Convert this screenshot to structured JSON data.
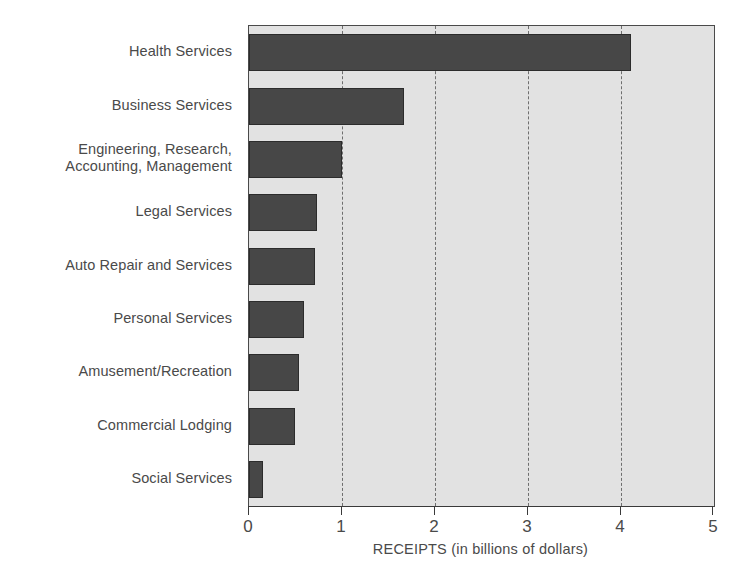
{
  "chart_data": {
    "type": "bar",
    "orientation": "horizontal",
    "title": "",
    "xlabel": "RECEIPTS (in billions of dollars)",
    "ylabel": "",
    "xlim": [
      0,
      5
    ],
    "xticks": [
      "0",
      "1",
      "2",
      "3",
      "4",
      "5"
    ],
    "grid": true,
    "gridlines_at": [
      1,
      2,
      3,
      4
    ],
    "legend": null,
    "categories": [
      "Health Services",
      "Business Services",
      "Engineering, Research,\nAccounting, Management",
      "Legal Services",
      "Auto Repair and Services",
      "Personal Services",
      "Amusement/Recreation",
      "Commercial Lodging",
      "Social Services"
    ],
    "values": [
      4.11,
      1.67,
      1.0,
      0.73,
      0.71,
      0.59,
      0.54,
      0.49,
      0.15
    ],
    "bar_color": "#474747",
    "plot_background": "#e2e2e2",
    "axis_color": "#3a3a3a"
  }
}
